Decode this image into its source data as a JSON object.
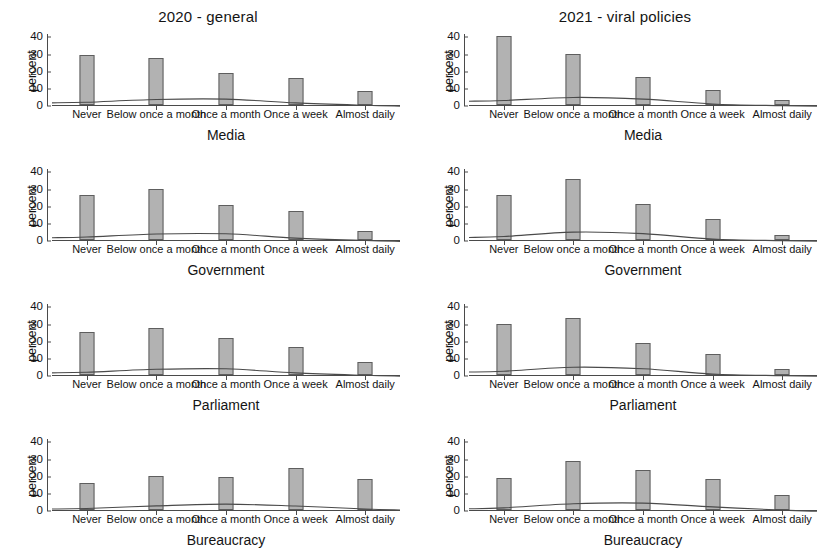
{
  "figure": {
    "column_titles": [
      "2020 - general",
      "2021 - viral policies"
    ],
    "y_axis_title": "percent",
    "y_ticks": [
      "0",
      "10",
      "20",
      "30",
      "40"
    ],
    "x_categories": [
      "Never",
      "Below once a month",
      "Once a month",
      "Once a week",
      "Almost daily"
    ],
    "bar_color": "#b2b2b2",
    "bar_border_color": "#5e5e5e",
    "curve_color": "#4a4a4a",
    "axis_color": "#4a4a4a"
  },
  "chart_data": [
    {
      "type": "bar",
      "title": "2020 - general",
      "xlabel": "Media",
      "ylabel": "percent",
      "ylim": [
        0,
        42
      ],
      "grid": false,
      "legend": "none",
      "categories": [
        "Never",
        "Below once a month",
        "Once a month",
        "Once a week",
        "Almost daily"
      ],
      "values": [
        29,
        27.5,
        18.5,
        15.5,
        8
      ],
      "overlay_curve": [
        2.2,
        3.8,
        4.0,
        1.8,
        0.4
      ]
    },
    {
      "type": "bar",
      "title": "2021 - viral policies",
      "xlabel": "Media",
      "ylabel": "percent",
      "ylim": [
        0,
        42
      ],
      "grid": false,
      "legend": "none",
      "categories": [
        "Never",
        "Below once a month",
        "Once a month",
        "Once a week",
        "Almost daily"
      ],
      "values": [
        40,
        30,
        16.5,
        8.5,
        3
      ],
      "overlay_curve": [
        3.2,
        5.0,
        4.0,
        1.2,
        0.2
      ]
    },
    {
      "type": "bar",
      "title": "2020 - general",
      "xlabel": "Government",
      "ylabel": "percent",
      "ylim": [
        0,
        42
      ],
      "grid": false,
      "legend": "none",
      "categories": [
        "Never",
        "Below once a month",
        "Once a month",
        "Once a week",
        "Almost daily"
      ],
      "values": [
        26,
        29.5,
        20.5,
        17,
        5.5
      ],
      "overlay_curve": [
        2.3,
        4.1,
        4.2,
        1.7,
        0.3
      ]
    },
    {
      "type": "bar",
      "title": "2021 - viral policies",
      "xlabel": "Government",
      "ylabel": "percent",
      "ylim": [
        0,
        42
      ],
      "grid": false,
      "legend": "none",
      "categories": [
        "Never",
        "Below once a month",
        "Once a month",
        "Once a week",
        "Almost daily"
      ],
      "values": [
        26.5,
        35.5,
        21,
        12,
        3
      ],
      "overlay_curve": [
        2.6,
        5.2,
        4.3,
        1.1,
        0.2
      ]
    },
    {
      "type": "bar",
      "title": "2020 - general",
      "xlabel": "Parliament",
      "ylabel": "percent",
      "ylim": [
        0,
        42
      ],
      "grid": false,
      "legend": "none",
      "categories": [
        "Never",
        "Below once a month",
        "Once a month",
        "Once a week",
        "Almost daily"
      ],
      "values": [
        25,
        27.5,
        21.5,
        16.5,
        7.5
      ],
      "overlay_curve": [
        2.2,
        3.9,
        4.2,
        1.8,
        0.4
      ]
    },
    {
      "type": "bar",
      "title": "2021 - viral policies",
      "xlabel": "Parliament",
      "ylabel": "percent",
      "ylim": [
        0,
        42
      ],
      "grid": false,
      "legend": "none",
      "categories": [
        "Never",
        "Below once a month",
        "Once a month",
        "Once a week",
        "Almost daily"
      ],
      "values": [
        29.5,
        33.5,
        18.5,
        12,
        3.5
      ],
      "overlay_curve": [
        2.8,
        5.1,
        4.2,
        1.2,
        0.2
      ]
    },
    {
      "type": "bar",
      "title": "2020 - general",
      "xlabel": "Bureaucracy",
      "ylabel": "percent",
      "ylim": [
        0,
        42
      ],
      "grid": false,
      "legend": "none",
      "categories": [
        "Never",
        "Below once a month",
        "Once a month",
        "Once a week",
        "Almost daily"
      ],
      "values": [
        15.5,
        20,
        19.5,
        24.5,
        18
      ],
      "overlay_curve": [
        1.5,
        3.0,
        4.0,
        2.9,
        1.2
      ]
    },
    {
      "type": "bar",
      "title": "2021 - viral policies",
      "xlabel": "Bureaucracy",
      "ylabel": "percent",
      "ylim": [
        0,
        42
      ],
      "grid": false,
      "legend": "none",
      "categories": [
        "Never",
        "Below once a month",
        "Once a month",
        "Once a week",
        "Almost daily"
      ],
      "values": [
        18.5,
        28.5,
        23.5,
        18,
        8.5
      ],
      "overlay_curve": [
        1.8,
        4.2,
        4.6,
        2.4,
        0.5
      ]
    }
  ]
}
